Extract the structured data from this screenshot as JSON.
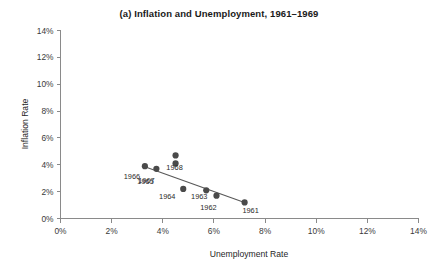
{
  "chart_data": {
    "type": "scatter",
    "title": "(a) Inflation and Unemployment, 1961–1969",
    "xlabel": "Unemployment Rate",
    "ylabel": "Inflation Rate",
    "xlim": [
      0,
      14
    ],
    "ylim": [
      0,
      14
    ],
    "xticks": [
      "0%",
      "2%",
      "4%",
      "6%",
      "8%",
      "10%",
      "12%",
      "14%"
    ],
    "xtick_values": [
      0,
      2,
      4,
      6,
      8,
      10,
      12,
      14
    ],
    "yticks": [
      "0%",
      "2%",
      "4%",
      "6%",
      "8%",
      "10%",
      "12%",
      "14%"
    ],
    "ytick_values": [
      0,
      2,
      4,
      6,
      8,
      10,
      12,
      14
    ],
    "grid": false,
    "legend": "none",
    "point_color": "#4a4a4a",
    "line_color": "#585858",
    "points": [
      {
        "label": "1961",
        "x": 7.2,
        "y": 1.2,
        "label_dx": 6,
        "label_dy": 11
      },
      {
        "label": "1962",
        "x": 6.1,
        "y": 1.7,
        "label_dx": -8,
        "label_dy": 14
      },
      {
        "label": "1963",
        "x": 5.7,
        "y": 2.1,
        "label_dx": -7,
        "label_dy": 9
      },
      {
        "label": "1964",
        "x": 4.8,
        "y": 2.2,
        "label_dx": -16,
        "label_dy": 10
      },
      {
        "label": "1965",
        "x": 4.5,
        "y": 4.1,
        "label_dx": -30,
        "label_dy": 21
      },
      {
        "label": "1968",
        "x": 4.5,
        "y": 4.7,
        "label_dx": -1,
        "label_dy": 15
      },
      {
        "label": "1966",
        "x": 3.3,
        "y": 3.9,
        "label_dx": -13,
        "label_dy": 13
      },
      {
        "label": "1967",
        "x": 3.75,
        "y": 3.7,
        "label_dx": -10,
        "label_dy": 14
      }
    ],
    "trend_line": {
      "x1": 3.3,
      "y1": 3.85,
      "x2": 7.25,
      "y2": 1.15
    }
  }
}
